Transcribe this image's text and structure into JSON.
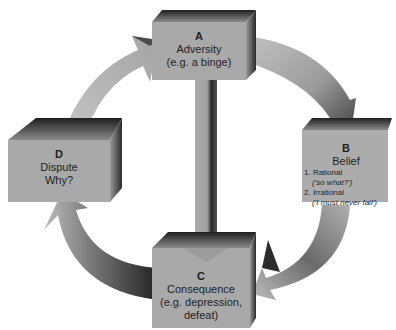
{
  "diagram": {
    "type": "ABCD cycle",
    "colors": {
      "box_face": "#a9a9a9",
      "box_top_dark": "#2a2a2a",
      "arrow_light": "#b8b8b8",
      "arrow_dark": "#333333",
      "background": "#ffffff"
    },
    "nodes": {
      "a": {
        "key": "A",
        "title": "Adversity",
        "subtitle": "(e.g. a binge)"
      },
      "b": {
        "key": "B",
        "title": "Belief",
        "items": [
          {
            "label": "1. Rational",
            "example": "('so what?')"
          },
          {
            "label": "2. Irrational",
            "example": "('I must never fail')"
          }
        ]
      },
      "c": {
        "key": "C",
        "title": "Consequence",
        "subtitle": "(e.g. depression,",
        "subtitle2": "defeat)"
      },
      "d": {
        "key": "D",
        "title": "Dispute",
        "subtitle": "Why?"
      }
    },
    "edges": [
      {
        "from": "D",
        "to": "A",
        "shape": "curved-arrow"
      },
      {
        "from": "A",
        "to": "B",
        "shape": "curved-arrow"
      },
      {
        "from": "B",
        "to": "C",
        "shape": "curved-arrow"
      },
      {
        "from": "C",
        "to": "D",
        "shape": "curved-arrow"
      },
      {
        "from": "A",
        "to": "C",
        "shape": "straight-arrow"
      }
    ]
  }
}
